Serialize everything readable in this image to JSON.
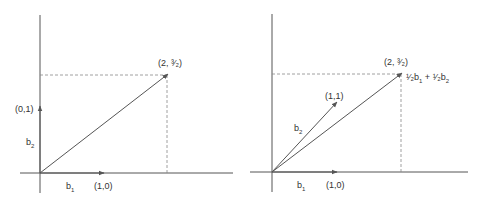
{
  "panels": [
    {
      "name": "standard-basis",
      "labels": {
        "b1": "b",
        "b1_sub": "1",
        "b2": "b",
        "b2_sub": "2",
        "b1_point": "(1,0)",
        "b2_point": "(0,1)",
        "target_point": "(2, ³⁄₂)"
      }
    },
    {
      "name": "alternate-basis",
      "labels": {
        "b1": "b",
        "b1_sub": "1",
        "b2": "b",
        "b2_sub": "2",
        "b1_point": "(1,0)",
        "b2_point": "(1,1)",
        "target_point": "(2, ³⁄₂)",
        "combo_c1": "¹⁄₂",
        "combo_b1": "b",
        "combo_b1_sub": "1",
        "combo_plus": " + ",
        "combo_c2": "¹⁄₂",
        "combo_b2": "b",
        "combo_b2_sub": "2"
      }
    }
  ],
  "colors": {
    "axis": "#555555",
    "vector": "#555555",
    "dashed": "#888888"
  }
}
